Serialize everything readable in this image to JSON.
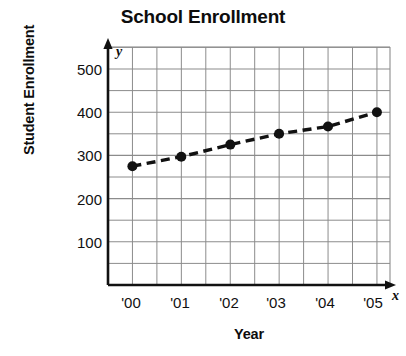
{
  "chart_data": {
    "type": "line",
    "title": "School Enrollment",
    "xlabel": "Year",
    "ylabel": "Student Enrollment",
    "x_axis_letter": "x",
    "y_axis_letter": "y",
    "categories": [
      "'00",
      "'01",
      "'02",
      "'03",
      "'04",
      "'05"
    ],
    "values": [
      275,
      297,
      325,
      350,
      367,
      400
    ],
    "series": [
      {
        "name": "Student Enrollment",
        "values": [
          275,
          297,
          325,
          350,
          367,
          400
        ]
      }
    ],
    "xtick_labels": [
      "'00",
      "'01",
      "'02",
      "'03",
      "'04",
      "'05"
    ],
    "ytick_labels": [
      "100",
      "200",
      "300",
      "400",
      "500"
    ],
    "ytick_values": [
      100,
      200,
      300,
      400,
      500
    ],
    "ylim": [
      0,
      550
    ],
    "xlim": [
      -0.95,
      5.7
    ],
    "grid": true,
    "grid_minor_step_y": 50,
    "legend": null,
    "legend_position": "none",
    "line_style": "dashed",
    "marker": "circle",
    "series_color": "#111111",
    "grid_color": "#8c8c8c",
    "axis_color": "#111111",
    "background_color": "#ffffff"
  }
}
